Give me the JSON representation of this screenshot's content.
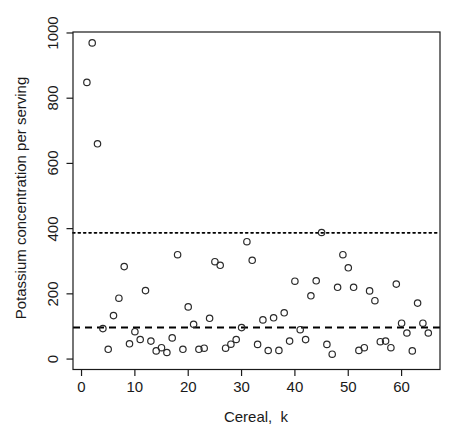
{
  "chart_data": {
    "type": "scatter",
    "title": "",
    "xlabel": "Cereal,  k",
    "ylabel": "Potassium concentration per serving",
    "x_ticks": [
      0,
      10,
      20,
      30,
      40,
      50,
      60
    ],
    "y_ticks": [
      0,
      200,
      400,
      600,
      800,
      1000
    ],
    "xlim": [
      -1.6,
      67.2
    ],
    "ylim": [
      -32,
      1003
    ],
    "grid": false,
    "legend": "none",
    "marker": "open-circle",
    "marker_color": "#2a2a2a",
    "box_color": "#1a1a1a",
    "reference_lines": [
      {
        "name": "dotted-upper-line",
        "style": "dotted",
        "y": 387,
        "color": "#000000"
      },
      {
        "name": "dashed-median-line",
        "style": "dashed",
        "y": 96.6,
        "color": "#000000"
      }
    ],
    "series": [
      {
        "name": "potassium-per-serving",
        "k": [
          1,
          2,
          3,
          4,
          5,
          6,
          7,
          8,
          9,
          10,
          11,
          12,
          13,
          14,
          15,
          16,
          17,
          18,
          19,
          20,
          21,
          22,
          23,
          24,
          25,
          26,
          27,
          28,
          29,
          30,
          31,
          32,
          33,
          34,
          35,
          36,
          37,
          38,
          39,
          40,
          41,
          42,
          43,
          44,
          45,
          46,
          47,
          48,
          49,
          50,
          51,
          52,
          53,
          54,
          55,
          56,
          57,
          58,
          59,
          60,
          61,
          62,
          63,
          64,
          65
        ],
        "values": [
          848.5,
          969.7,
          660,
          93.3,
          30,
          133.3,
          186.6,
          283.6,
          46.7,
          84,
          60,
          210,
          55,
          25,
          35,
          20,
          65,
          320,
          30,
          160,
          106.7,
          30,
          33.3,
          125,
          298.5,
          287.5,
          33.3,
          45.5,
          60,
          96.6,
          360,
          303,
          45,
          120,
          26.3,
          126.7,
          26.7,
          141.8,
          55,
          238.8,
          90,
          59.7,
          194,
          240,
          388.1,
          45,
          15,
          220,
          320,
          280,
          220,
          26.5,
          35,
          209,
          179.1,
          53.3,
          55,
          35,
          230,
          110,
          80,
          25,
          171.6,
          110,
          80
        ]
      }
    ]
  }
}
